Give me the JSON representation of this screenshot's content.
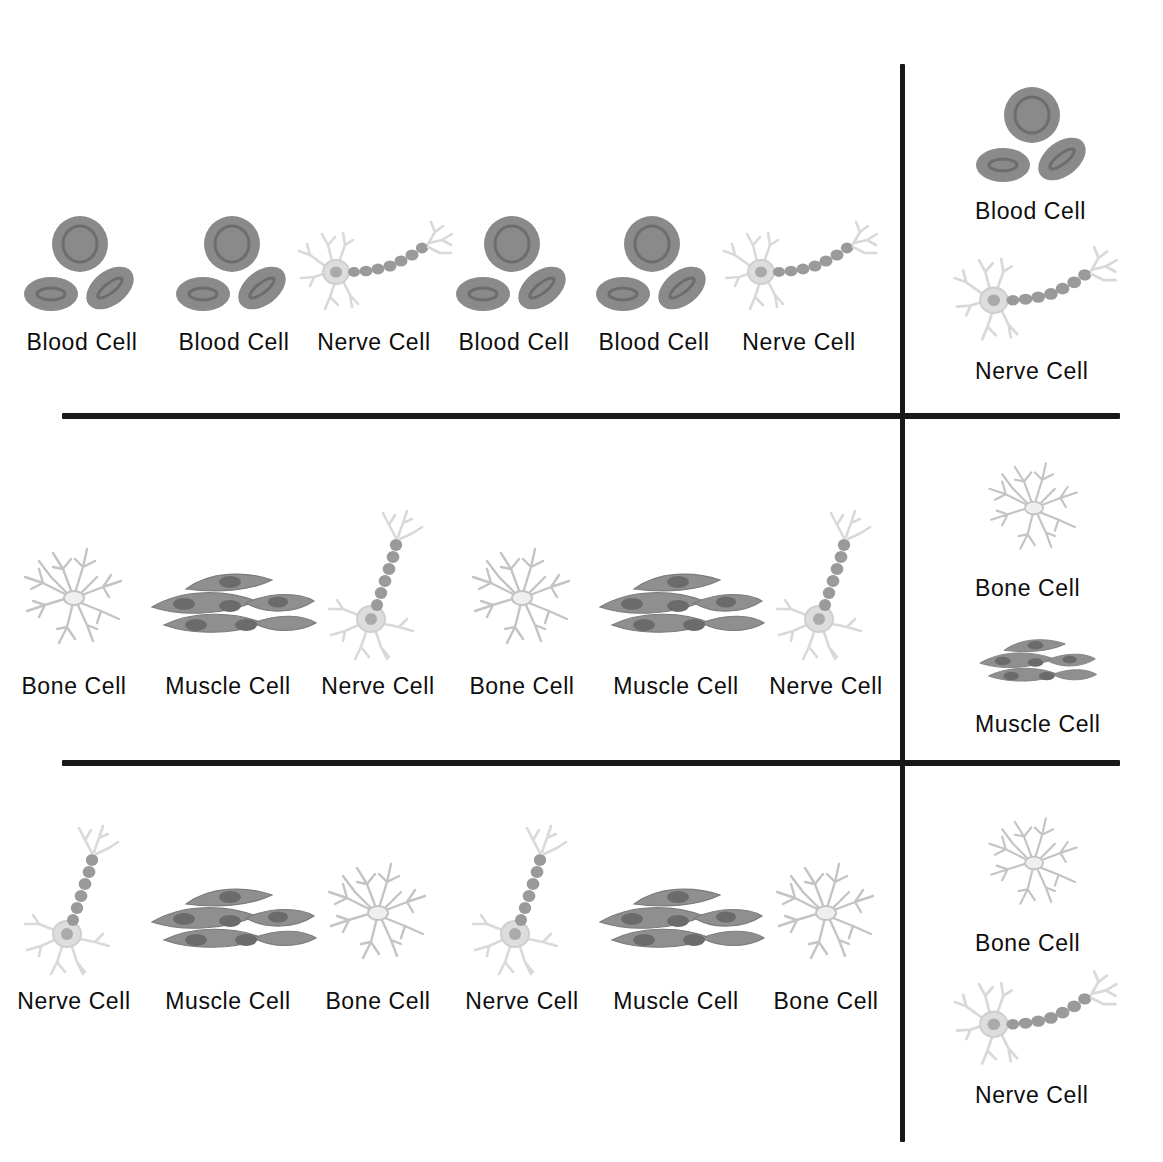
{
  "colors": {
    "ink": "#181818",
    "text": "#0d0d0d",
    "blood_cell": "#8a8a8a",
    "blood_cell_dark": "#6f6f6f",
    "muscle_cell": "#8f8f8f",
    "muscle_cell_dark": "#6b6b6b",
    "nerve_cell": "#d8d8d8",
    "nerve_axon": "#9a9a9a",
    "bone_cell": "#c9c9c9",
    "background": "#ffffff"
  },
  "cell_types": {
    "blood": {
      "label": "Blood Cell",
      "icon": "blood-cell-icon"
    },
    "nerve": {
      "label": "Nerve Cell",
      "icon": "nerve-cell-icon"
    },
    "muscle": {
      "label": "Muscle Cell",
      "icon": "muscle-cell-icon"
    },
    "bone": {
      "label": "Bone Cell",
      "icon": "bone-cell-icon"
    }
  },
  "rows": [
    {
      "id": "row-1",
      "pattern": [
        "blood",
        "blood",
        "nerve",
        "blood",
        "blood",
        "nerve"
      ],
      "items": [
        {
          "type": "blood",
          "label": "Blood Cell"
        },
        {
          "type": "blood",
          "label": "Blood Cell"
        },
        {
          "type": "nerve",
          "label": "Nerve Cell"
        },
        {
          "type": "blood",
          "label": "Blood Cell"
        },
        {
          "type": "blood",
          "label": "Blood Cell"
        },
        {
          "type": "nerve",
          "label": "Nerve Cell"
        }
      ],
      "legend": [
        {
          "type": "blood",
          "label": "Blood Cell"
        },
        {
          "type": "nerve",
          "label": "Nerve Cell"
        }
      ]
    },
    {
      "id": "row-2",
      "pattern": [
        "bone",
        "muscle",
        "nerve",
        "bone",
        "muscle",
        "nerve"
      ],
      "items": [
        {
          "type": "bone",
          "label": "Bone Cell"
        },
        {
          "type": "muscle",
          "label": "Muscle Cell"
        },
        {
          "type": "nerve",
          "label": "Nerve Cell"
        },
        {
          "type": "bone",
          "label": "Bone Cell"
        },
        {
          "type": "muscle",
          "label": "Muscle Cell"
        },
        {
          "type": "nerve",
          "label": "Nerve Cell"
        }
      ],
      "legend": [
        {
          "type": "bone",
          "label": "Bone Cell"
        },
        {
          "type": "muscle",
          "label": "Muscle Cell"
        }
      ]
    },
    {
      "id": "row-3",
      "pattern": [
        "nerve",
        "muscle",
        "bone",
        "nerve",
        "muscle",
        "bone"
      ],
      "items": [
        {
          "type": "nerve",
          "label": "Nerve Cell"
        },
        {
          "type": "muscle",
          "label": "Muscle Cell"
        },
        {
          "type": "bone",
          "label": "Bone Cell"
        },
        {
          "type": "nerve",
          "label": "Nerve Cell"
        },
        {
          "type": "muscle",
          "label": "Muscle Cell"
        },
        {
          "type": "bone",
          "label": "Bone Cell"
        }
      ],
      "legend": [
        {
          "type": "bone",
          "label": "Bone Cell"
        },
        {
          "type": "nerve",
          "label": "Nerve Cell"
        }
      ]
    }
  ]
}
